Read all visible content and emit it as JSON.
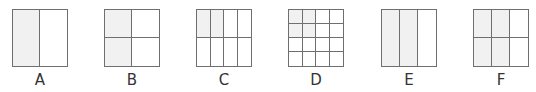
{
  "figures": [
    {
      "label": "A",
      "rows": 1,
      "cols": 2,
      "shaded": [
        0
      ],
      "left": 12
    },
    {
      "label": "B",
      "rows": 2,
      "cols": 2,
      "shaded": [
        0,
        2
      ],
      "left": 104
    },
    {
      "label": "C",
      "rows": 2,
      "cols": 4,
      "shaded": [
        0,
        1
      ],
      "left": 196
    },
    {
      "label": "D",
      "rows": 4,
      "cols": 4,
      "shaded": [
        0,
        1,
        4,
        5
      ],
      "left": 288
    },
    {
      "label": "E",
      "rows": 1,
      "cols": 3,
      "shaded": [
        0,
        1
      ],
      "left": 381
    },
    {
      "label": "F",
      "rows": 2,
      "cols": 3,
      "shaded": [
        0,
        1,
        3,
        4
      ],
      "left": 473
    }
  ],
  "colors": {
    "line": "#6f6f6f",
    "shade": "#f1f1f1",
    "label": "#333333"
  }
}
